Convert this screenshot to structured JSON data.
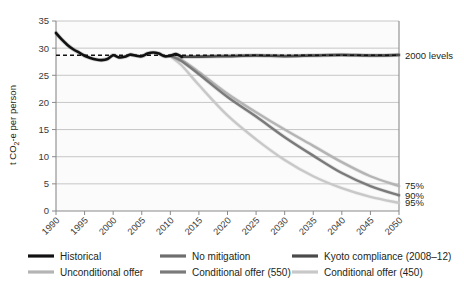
{
  "chart_data": {
    "type": "line",
    "title": "",
    "xlabel": "",
    "ylabel": "t CO2-e per person",
    "ylabel_rich": "t CO₂-e per person",
    "xlim": [
      1990,
      2050
    ],
    "ylim": [
      0,
      35
    ],
    "ytick_values": [
      "0",
      "5",
      "10",
      "15",
      "20",
      "25",
      "30",
      "35"
    ],
    "xtick_values": [
      "1990",
      "1995",
      "2000",
      "2005",
      "2010",
      "2015",
      "2020",
      "2025",
      "2030",
      "2035",
      "2040",
      "2045",
      "2050"
    ],
    "grid": "horizontal",
    "legend_position": "below-axes",
    "annotations": [
      {
        "name": "2000-levels",
        "text": "2000 levels",
        "x": 2050,
        "y": 28.7
      },
      {
        "name": "target-75",
        "text": "75%",
        "x": 2050,
        "y": 4.6
      },
      {
        "name": "target-90",
        "text": "90%",
        "x": 2050,
        "y": 2.9
      },
      {
        "name": "target-95",
        "text": "95%",
        "x": 2050,
        "y": 1.5
      }
    ],
    "reference_line": {
      "name": "2000-levels-dashed",
      "value": 28.7,
      "style": "dashed",
      "color": "#111111"
    },
    "series": [
      {
        "name": "Historical",
        "color": "#111111",
        "width": 2.6,
        "x": [
          1990,
          1991,
          1992,
          1993,
          1994,
          1995,
          1996,
          1997,
          1998,
          1999,
          2000,
          2001,
          2002,
          2003,
          2004,
          2005,
          2006,
          2007,
          2008,
          2009,
          2010,
          2011,
          2012
        ],
        "values": [
          32.8,
          31.6,
          30.6,
          29.8,
          29.2,
          28.6,
          28.2,
          27.9,
          27.8,
          28.0,
          28.7,
          28.3,
          28.4,
          28.8,
          28.6,
          28.5,
          29.0,
          29.2,
          29.0,
          28.5,
          28.6,
          28.9,
          28.4
        ]
      },
      {
        "name": "No mitigation",
        "color": "#6e6e6e",
        "width": 2.2,
        "x": [
          2012,
          2015,
          2020,
          2025,
          2030,
          2035,
          2040,
          2045,
          2050
        ],
        "values": [
          28.4,
          28.5,
          28.6,
          28.7,
          28.6,
          28.7,
          28.8,
          28.7,
          28.8
        ]
      },
      {
        "name": "Kyoto compliance (2008–12)",
        "color": "#4a4a4a",
        "width": 2.2,
        "x": [
          2012,
          2015,
          2020,
          2025,
          2030,
          2035,
          2040,
          2045,
          2050
        ],
        "values": [
          28.4,
          28.4,
          28.5,
          28.6,
          28.5,
          28.6,
          28.7,
          28.6,
          28.7
        ]
      },
      {
        "name": "Unconditional offer",
        "color": "#b4b4b4",
        "width": 2.4,
        "x": [
          2010,
          2012,
          2015,
          2020,
          2025,
          2030,
          2035,
          2040,
          2045,
          2050
        ],
        "values": [
          28.6,
          27.8,
          25.6,
          21.6,
          18.2,
          15.0,
          12.0,
          9.0,
          6.4,
          4.6
        ]
      },
      {
        "name": "Conditional offer (550)",
        "color": "#7a7a7a",
        "width": 2.4,
        "x": [
          2010,
          2012,
          2015,
          2020,
          2025,
          2030,
          2035,
          2040,
          2045,
          2050
        ],
        "values": [
          28.6,
          27.6,
          25.2,
          21.0,
          17.4,
          13.6,
          10.2,
          7.0,
          4.6,
          2.9
        ]
      },
      {
        "name": "Conditional offer (450)",
        "color": "#c8c8c8",
        "width": 2.4,
        "x": [
          2010,
          2012,
          2015,
          2020,
          2025,
          2030,
          2035,
          2040,
          2045,
          2050
        ],
        "values": [
          28.5,
          26.8,
          23.2,
          17.6,
          13.2,
          9.4,
          6.4,
          4.2,
          2.6,
          1.5
        ]
      }
    ]
  },
  "legend": {
    "items": [
      {
        "label": "Historical",
        "color": "#111111",
        "name": "legend-historical"
      },
      {
        "label": "No mitigation",
        "color": "#6e6e6e",
        "name": "legend-no-mitigation"
      },
      {
        "label": "Kyoto compliance (2008–12)",
        "color": "#4a4a4a",
        "name": "legend-kyoto-compliance"
      },
      {
        "label": "Unconditional offer",
        "color": "#b4b4b4",
        "name": "legend-unconditional-offer"
      },
      {
        "label": "Conditional offer (550)",
        "color": "#7a7a7a",
        "name": "legend-conditional-offer-550"
      },
      {
        "label": "Conditional offer (450)",
        "color": "#c8c8c8",
        "name": "legend-conditional-offer-450"
      }
    ]
  },
  "colors": {
    "axis": "#8a8a8a",
    "grid": "#b9b9b9",
    "text": "#231f20",
    "background": "#ffffff"
  }
}
